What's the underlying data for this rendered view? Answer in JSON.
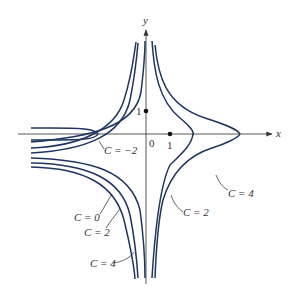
{
  "figure": {
    "axes": {
      "x_label": "x",
      "y_label": "y",
      "origin_label": "0",
      "x_tick_label": "1",
      "y_tick_label": "1"
    },
    "curve_labels": [
      {
        "id": "c_neg2",
        "text": "C = −2"
      },
      {
        "id": "c0",
        "text": "C = 0"
      },
      {
        "id": "c2_left",
        "text": "C = 2"
      },
      {
        "id": "c4_left",
        "text": "C = 4"
      },
      {
        "id": "c2_right",
        "text": "C = 2"
      },
      {
        "id": "c4_right",
        "text": "C = 4"
      }
    ],
    "colors": {
      "curve": "#1f3560",
      "axis": "#444444",
      "background": "#ffffff"
    }
  }
}
